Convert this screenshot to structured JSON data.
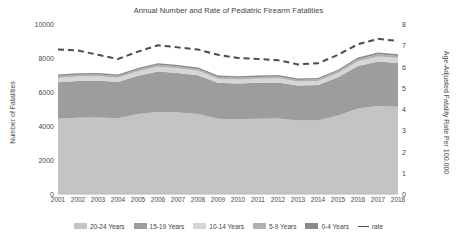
{
  "chart_data": {
    "type": "area",
    "title": "Annual Number and Rate of Pediatric Firearm Fatalities",
    "xlabel": "",
    "ylabel": "Number of Fatalities",
    "y2label": "Age-Adjusted Fatality Rate Per 100,000",
    "grid": false,
    "legend_position": "bottom",
    "ylim": [
      0,
      10000
    ],
    "y2lim": [
      0,
      8
    ],
    "yticks": [
      0,
      2000,
      4000,
      6000,
      8000,
      10000
    ],
    "y2ticks": [
      0,
      1,
      2,
      3,
      4,
      5,
      6,
      7,
      8
    ],
    "categories": [
      "2001",
      "2002",
      "2003",
      "2004",
      "2005",
      "2006",
      "2007",
      "2008",
      "2009",
      "2010",
      "2011",
      "2012",
      "2013",
      "2014",
      "2015",
      "2016",
      "2017",
      "2018"
    ],
    "stack_order_bottom_to_top": [
      "20-24 Years",
      "15-19 Years",
      "10-14 Years",
      "5-9 Years",
      "0-4 Years"
    ],
    "series": [
      {
        "name": "20-24 Years",
        "color": "#c4c4c4",
        "values": [
          4420,
          4480,
          4500,
          4460,
          4700,
          4830,
          4800,
          4700,
          4420,
          4400,
          4430,
          4440,
          4320,
          4330,
          4620,
          5030,
          5180,
          5130
        ]
      },
      {
        "name": "15-19 Years",
        "color": "#9d9d9d",
        "values": [
          2150,
          2170,
          2180,
          2130,
          2260,
          2380,
          2320,
          2280,
          2120,
          2100,
          2110,
          2120,
          2060,
          2080,
          2250,
          2500,
          2620,
          2580
        ]
      },
      {
        "name": "10-14 Years",
        "color": "#d6d6d6",
        "values": [
          260,
          255,
          250,
          250,
          260,
          275,
          270,
          265,
          245,
          240,
          245,
          250,
          235,
          240,
          255,
          280,
          295,
          290
        ]
      },
      {
        "name": "5-9 Years",
        "color": "#b0b0b0",
        "values": [
          105,
          103,
          100,
          100,
          105,
          112,
          110,
          106,
          98,
          97,
          99,
          100,
          95,
          96,
          103,
          115,
          122,
          118
        ]
      },
      {
        "name": "0-4 Years",
        "color": "#8a8a8a",
        "values": [
          90,
          88,
          86,
          85,
          90,
          95,
          94,
          90,
          84,
          83,
          85,
          86,
          82,
          83,
          88,
          98,
          104,
          101
        ]
      }
    ],
    "rate_series": {
      "name": "rate",
      "color": "#4d4d4d",
      "style": "dashed",
      "axis": "right",
      "values": [
        6.8,
        6.75,
        6.55,
        6.35,
        6.7,
        7.0,
        6.9,
        6.8,
        6.55,
        6.4,
        6.35,
        6.3,
        6.1,
        6.15,
        6.55,
        7.05,
        7.3,
        7.2
      ]
    }
  },
  "legend": {
    "items": [
      {
        "label": "20-24 Years",
        "marker": "swatch",
        "color": "#c4c4c4"
      },
      {
        "label": "15-19 Years",
        "marker": "swatch",
        "color": "#9d9d9d"
      },
      {
        "label": "10-14 Years",
        "marker": "swatch",
        "color": "#d6d6d6"
      },
      {
        "label": "5-9 Years",
        "marker": "swatch",
        "color": "#b0b0b0"
      },
      {
        "label": "0-4 Years",
        "marker": "swatch",
        "color": "#8a8a8a"
      },
      {
        "label": "rate",
        "marker": "dashed-line",
        "color": "#4d4d4d"
      }
    ]
  }
}
